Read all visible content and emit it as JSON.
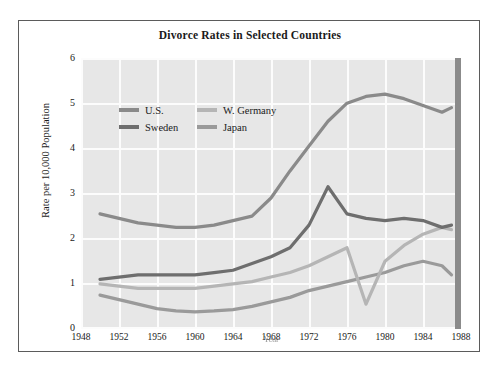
{
  "figure": {
    "title": "Divorce Rates in Selected Countries",
    "background_color": "#ffffff",
    "plot_background_color": "#e7e7e7",
    "grid_color": "#fcfcfc",
    "frame_color": "#5b5b5b"
  },
  "axes": {
    "ylabel": "Rate per 10,000 Population",
    "xlabel": "Year",
    "yticks": [
      "0",
      "1",
      "2",
      "3",
      "4",
      "5",
      "6"
    ],
    "xticks": [
      "1948",
      "1952",
      "1956",
      "1960",
      "1964",
      "1968",
      "1972",
      "1976",
      "1980",
      "1984",
      "1988"
    ]
  },
  "legend": {
    "entries": [
      {
        "label": "U.S.",
        "color": "#8a8a8a"
      },
      {
        "label": "Sweden",
        "color": "#6e6e6e"
      },
      {
        "label": "W. Germany",
        "color": "#b5b5b5"
      },
      {
        "label": "Japan",
        "color": "#9a9a9a"
      }
    ]
  },
  "chart_data": {
    "type": "line",
    "title": "Divorce Rates in Selected Countries",
    "xlabel": "Year",
    "ylabel": "Rate per 10,000 Population",
    "xlim": [
      1948,
      1988
    ],
    "ylim": [
      0,
      6
    ],
    "grid": true,
    "legend_position": "upper-left-inside",
    "x": [
      1950,
      1952,
      1954,
      1956,
      1958,
      1960,
      1962,
      1964,
      1966,
      1968,
      1970,
      1972,
      1974,
      1976,
      1978,
      1980,
      1982,
      1984,
      1986,
      1987
    ],
    "series": [
      {
        "name": "U.S.",
        "color": "#8a8a8a",
        "values": [
          2.55,
          2.45,
          2.35,
          2.3,
          2.25,
          2.25,
          2.3,
          2.4,
          2.5,
          2.9,
          3.5,
          4.05,
          4.6,
          5.0,
          5.15,
          5.2,
          5.1,
          4.95,
          4.8,
          4.9
        ]
      },
      {
        "name": "Sweden",
        "color": "#6e6e6e",
        "values": [
          1.1,
          1.15,
          1.2,
          1.2,
          1.2,
          1.2,
          1.25,
          1.3,
          1.45,
          1.6,
          1.8,
          2.3,
          3.15,
          2.55,
          2.45,
          2.4,
          2.45,
          2.4,
          2.25,
          2.3
        ]
      },
      {
        "name": "W. Germany",
        "color": "#b5b5b5",
        "values": [
          1.0,
          0.95,
          0.9,
          0.9,
          0.9,
          0.9,
          0.95,
          1.0,
          1.05,
          1.15,
          1.25,
          1.4,
          1.6,
          1.8,
          0.55,
          1.5,
          1.85,
          2.1,
          2.25,
          2.2
        ]
      },
      {
        "name": "Japan",
        "color": "#9a9a9a",
        "values": [
          0.75,
          0.65,
          0.55,
          0.45,
          0.4,
          0.38,
          0.4,
          0.43,
          0.5,
          0.6,
          0.7,
          0.85,
          0.95,
          1.05,
          1.15,
          1.25,
          1.4,
          1.5,
          1.4,
          1.2
        ]
      }
    ]
  }
}
